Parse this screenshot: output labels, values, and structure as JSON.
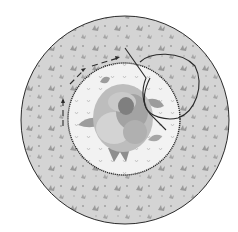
{
  "figure": {
    "type": "applique-stitching-illustration",
    "width": 238,
    "height": 232,
    "colors": {
      "background": "#ffffff",
      "fabric_fill": "#d4d4d4",
      "fabric_motif": "#9a9a9a",
      "center_fill": "#f2f2f2",
      "rose_light": "#bdbdbd",
      "rose_mid": "#a3a3a3",
      "rose_dark": "#7f7f7f",
      "leaf": "#9c9c9c",
      "outline": "#2a2a2a"
    },
    "elements": {
      "outer_circle": {
        "cx": 125,
        "cy": 120,
        "r": 104
      },
      "inner_circle": {
        "cx": 124,
        "cy": 119,
        "r": 56,
        "edge": "scalloped-stitch"
      },
      "rose": {
        "cx": 122,
        "cy": 118
      },
      "folded_flap": {
        "description": "fabric edge folded back with loop"
      },
      "dashed_arrow": {
        "description": "dashed stitching direction arrow around circle"
      }
    }
  }
}
